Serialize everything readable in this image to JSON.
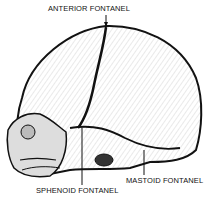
{
  "diagram": {
    "labels": {
      "anterior": "ANTERIOR FONTANEL",
      "sphenoid": "SPHENOID FONTANEL",
      "mastoid": "MASTOID FONTANEL"
    }
  }
}
